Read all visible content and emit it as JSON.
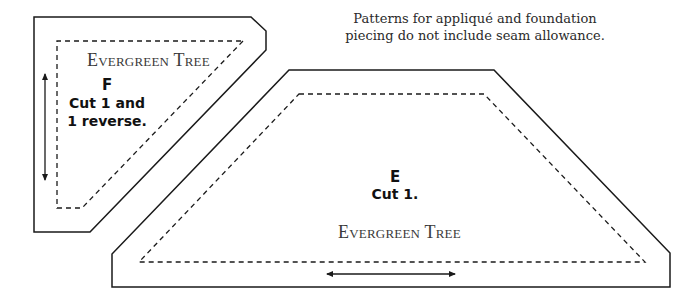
{
  "note": {
    "line1": "Patterns for appliqué and foundation",
    "line2": "piecing do not include seam allowance."
  },
  "pieces": [
    {
      "id": "F",
      "name": "Evergreen Tree",
      "letter": "F",
      "cut_line1": "Cut 1 and",
      "cut_line2": "1 reverse.",
      "grain_arrow": "vertical"
    },
    {
      "id": "E",
      "name": "Evergreen Tree",
      "letter": "E",
      "cut_line1": "Cut 1.",
      "grain_arrow": "horizontal"
    }
  ],
  "colors": {
    "line": "#1a1a1a",
    "background": "#ffffff"
  }
}
